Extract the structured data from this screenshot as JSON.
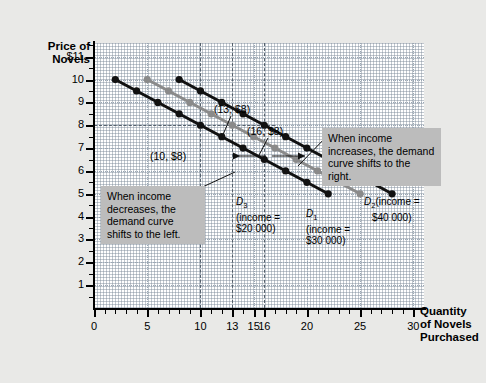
{
  "chart_data": {
    "type": "line",
    "title": "",
    "xlabel": "Quantity of Novels Purchased",
    "ylabel": "Price of Novels",
    "xlim": [
      0,
      31
    ],
    "ylim": [
      0,
      11.6
    ],
    "grid": true,
    "legend_position": "inline-labels",
    "xticks": [
      0,
      5,
      10,
      13,
      15,
      16,
      20,
      25,
      30
    ],
    "xtick_labels": [
      "0",
      "5",
      "10",
      "13",
      "15",
      "16",
      "20",
      "25",
      "30"
    ],
    "yticks": [
      1,
      2,
      3,
      4,
      5,
      6,
      7,
      8,
      9,
      10,
      11
    ],
    "ytick_labels": [
      "1",
      "2",
      "3",
      "4",
      "5",
      "6",
      "7",
      "8",
      "9",
      "10",
      "$11"
    ],
    "series": [
      {
        "name": "D3",
        "income": "$20 000",
        "color": "#111111",
        "x": [
          2,
          4,
          6,
          8,
          10,
          12,
          14,
          16,
          18,
          20,
          22
        ],
        "y": [
          10,
          9.5,
          9,
          8.5,
          8,
          7.5,
          7,
          6.5,
          6,
          5.5,
          5
        ]
      },
      {
        "name": "D1",
        "income": "$30 000",
        "color": "#8a8a8a",
        "x": [
          5,
          7,
          9,
          11,
          13,
          15,
          17,
          19,
          21,
          23,
          25
        ],
        "y": [
          10,
          9.5,
          9,
          8.5,
          8,
          7.5,
          7,
          6.5,
          6,
          5.5,
          5
        ]
      },
      {
        "name": "D2",
        "income": "$40 000",
        "color": "#111111",
        "x": [
          8,
          10,
          12,
          14,
          16,
          18,
          20,
          22,
          24,
          26,
          28
        ],
        "y": [
          10,
          9.5,
          9,
          8.5,
          8,
          7.5,
          7,
          6.5,
          6,
          5.5,
          5
        ]
      }
    ],
    "annotations": [
      {
        "name": "point-label-10-8",
        "text": "(10, $8)",
        "x": 10,
        "y": 8
      },
      {
        "name": "point-label-13-8",
        "text": "(13, $8)",
        "x": 13,
        "y": 8
      },
      {
        "name": "point-label-16-8",
        "text": "(16, $8)",
        "x": 16,
        "y": 8
      }
    ],
    "reference_lines": {
      "horizontal": [
        8
      ],
      "vertical": [
        10,
        13,
        16
      ]
    }
  },
  "axis": {
    "y_title_line1": "Price of",
    "y_title_line2": "Novels",
    "x_title_line1": "Quantity",
    "x_title_line2": "of Novels",
    "x_title_line3": "Purchased"
  },
  "callouts": {
    "increase": "When income increases, the demand curve shifts to the right.",
    "decrease": "When income decreases, the demand curve shifts to the left."
  },
  "curve_labels": {
    "d3_name": "D",
    "d3_sub": "3",
    "d3_income_line1": "(income =",
    "d3_income_line2": "$20 000)",
    "d1_name": "D",
    "d1_sub": "1",
    "d1_income_line1": "(income =",
    "d1_income_line2": "$30 000)",
    "d2_name": "D",
    "d2_sub": "2",
    "d2_income_line1": "(income =",
    "d2_income_line2": "$40 000)"
  },
  "point_labels": {
    "p10": "(10, $8)",
    "p13": "(13, $8)",
    "p16": "(16, $8)"
  },
  "colors": {
    "background": "#e9e9e7",
    "plot_background": "#ffffff",
    "curve_dark": "#111111",
    "curve_gray": "#8a8a8a",
    "callout_background": "#bcbcbc",
    "grid": "#9aa7b4"
  }
}
